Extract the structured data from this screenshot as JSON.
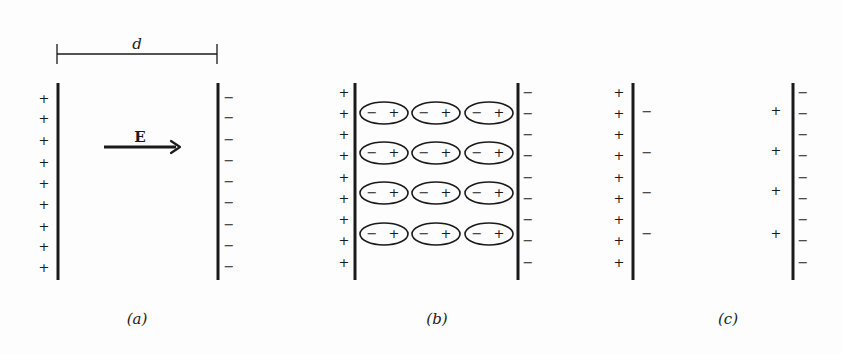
{
  "figure": {
    "colors": {
      "ink": "#1a1a1a",
      "background": "#fdfdfd"
    },
    "panels": [
      {
        "id": "a",
        "caption": "(a)",
        "caption_pos": [
          137,
          320
        ],
        "dimension": {
          "label": "d",
          "x1": 57,
          "x2": 217,
          "y": 54,
          "label_pos": [
            137,
            45
          ]
        },
        "field": {
          "label": "E",
          "x1": 104,
          "x2": 180,
          "y": 147,
          "label_pos": [
            140,
            138
          ]
        },
        "plates": [
          {
            "x": 58,
            "y1": 83,
            "y2": 280,
            "outer_charges": {
              "sign": "+",
              "x": 44,
              "ys": [
                99,
                119,
                141,
                163,
                184,
                205,
                227,
                247,
                268
              ]
            }
          },
          {
            "x": 218,
            "y1": 83,
            "y2": 280,
            "outer_charges": {
              "sign": "−",
              "x": 229,
              "ys": [
                98,
                118,
                140,
                161,
                182,
                203,
                225,
                246,
                267
              ]
            }
          }
        ]
      },
      {
        "id": "b",
        "caption": "(b)",
        "caption_pos": [
          437,
          320
        ],
        "plates": [
          {
            "x": 355,
            "y1": 83,
            "y2": 280,
            "outer_charges": {
              "sign": "+",
              "x": 344,
              "ys": [
                93,
                114,
                135,
                156,
                178,
                199,
                220,
                241,
                263
              ]
            }
          },
          {
            "x": 518,
            "y1": 83,
            "y2": 280,
            "outer_charges": {
              "sign": "−",
              "x": 528,
              "ys": [
                93,
                114,
                135,
                156,
                178,
                199,
                220,
                241,
                263
              ]
            }
          }
        ],
        "dipoles": {
          "columns_cx": [
            384,
            436,
            489
          ],
          "rows_cy": [
            113,
            153,
            193,
            234
          ],
          "rx": 24,
          "ry": 11,
          "neg_label": "−",
          "pos_label": "+"
        }
      },
      {
        "id": "c",
        "caption": "(c)",
        "caption_pos": [
          728,
          320
        ],
        "plates": [
          {
            "x": 633,
            "y1": 83,
            "y2": 280,
            "outer_charges": {
              "sign": "+",
              "x": 619,
              "ys": [
                93,
                114,
                135,
                156,
                178,
                199,
                220,
                241,
                263
              ]
            },
            "inner_charges": {
              "sign": "−",
              "x": 647,
              "ys": [
                112,
                153,
                193,
                234
              ]
            }
          },
          {
            "x": 793,
            "y1": 83,
            "y2": 280,
            "outer_charges": {
              "sign": "−",
              "x": 803,
              "ys": [
                93,
                114,
                135,
                156,
                178,
                199,
                220,
                241,
                263
              ]
            },
            "inner_charges": {
              "sign": "+",
              "x": 776,
              "ys": [
                111,
                151,
                191,
                234
              ]
            }
          }
        ]
      }
    ]
  }
}
